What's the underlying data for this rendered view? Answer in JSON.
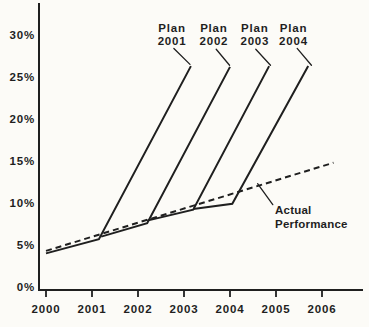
{
  "figure": {
    "background": "#fcfbf7",
    "ink": "#1f1f1f"
  },
  "chart_data": {
    "type": "line",
    "title": "",
    "xlabel": "",
    "ylabel": "",
    "x_ticks": [
      "2000",
      "2001",
      "2002",
      "2003",
      "2004",
      "2005",
      "2006"
    ],
    "x_tick_values": [
      2000,
      2001,
      2002,
      2003,
      2004,
      2005,
      2006
    ],
    "y_ticks": [
      "0%",
      "5%",
      "10%",
      "15%",
      "20%",
      "25%",
      "30%"
    ],
    "y_tick_values": [
      0,
      5,
      10,
      15,
      20,
      25,
      30
    ],
    "xlim": [
      1999.85,
      2006.9
    ],
    "ylim": [
      0,
      33.8
    ],
    "grid": false,
    "legend_position": "none",
    "series": [
      {
        "name": "Plan 2001",
        "style": "solid",
        "points": [
          [
            2000.0,
            4.0
          ],
          [
            2001.15,
            5.7
          ],
          [
            2003.15,
            26.3
          ]
        ]
      },
      {
        "name": "Plan 2002",
        "style": "solid",
        "points": [
          [
            2001.2,
            6.0
          ],
          [
            2002.2,
            7.6
          ],
          [
            2004.0,
            26.2
          ]
        ]
      },
      {
        "name": "Plan 2003",
        "style": "solid",
        "points": [
          [
            2002.2,
            7.9
          ],
          [
            2003.2,
            9.2
          ],
          [
            2004.85,
            26.3
          ]
        ]
      },
      {
        "name": "Plan 2004",
        "style": "solid",
        "points": [
          [
            2003.2,
            9.3
          ],
          [
            2004.05,
            9.9
          ],
          [
            2005.7,
            26.3
          ]
        ]
      },
      {
        "name": "Actual Performance",
        "style": "dashed",
        "points": [
          [
            2000.0,
            4.3
          ],
          [
            2006.25,
            14.8
          ]
        ]
      }
    ],
    "annotations": {
      "plan_labels": [
        {
          "lines": [
            "Plan",
            "2001"
          ],
          "x": 2002.74,
          "y_top": 31.7,
          "leader": [
            [
              2002.78,
              28.4
            ],
            [
              2003.13,
              26.5
            ]
          ]
        },
        {
          "lines": [
            "Plan",
            "2002"
          ],
          "x": 2003.65,
          "y_top": 31.7,
          "leader": [
            [
              2003.7,
              28.3
            ],
            [
              2003.99,
              26.4
            ]
          ]
        },
        {
          "lines": [
            "Plan",
            "2003"
          ],
          "x": 2004.54,
          "y_top": 31.7,
          "leader": [
            [
              2004.56,
              28.3
            ],
            [
              2004.88,
              26.4
            ]
          ]
        },
        {
          "lines": [
            "Plan",
            "2004"
          ],
          "x": 2005.38,
          "y_top": 31.7,
          "leader": [
            [
              2005.46,
              28.4
            ],
            [
              2005.77,
              26.4
            ]
          ]
        }
      ],
      "actual_label": {
        "lines": [
          "Actual",
          "Performance"
        ],
        "x": 2004.98,
        "y_top": 10.0,
        "leader": [
          [
            2004.6,
            12.3
          ],
          [
            2004.93,
            9.8
          ]
        ]
      }
    }
  }
}
